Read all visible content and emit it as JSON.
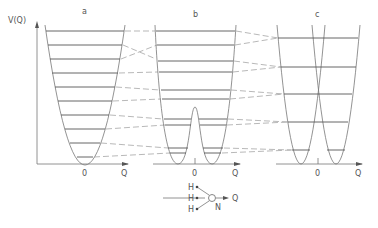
{
  "figure": {
    "panels": [
      {
        "id": "a",
        "label": "a",
        "description": "single harmonic well"
      },
      {
        "id": "b",
        "label": "b",
        "description": "double well with central barrier"
      },
      {
        "id": "c",
        "label": "c",
        "description": "two separated harmonic wells"
      }
    ],
    "axes": {
      "y_label": "V(Q)",
      "x_label": "Q",
      "origin_label": "0"
    },
    "molecule": {
      "atoms": [
        "H",
        "H",
        "H"
      ],
      "center_atom": "N",
      "coordinate_label": "Q"
    }
  }
}
